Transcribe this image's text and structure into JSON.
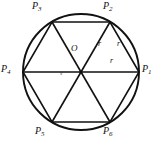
{
  "figure": {
    "stroke_color": "#111111",
    "background_color": "#ffffff",
    "circle": {
      "center_x": 81,
      "center_y": 72,
      "radius": 58,
      "stroke_width": 1.8
    },
    "hexagon": {
      "stroke_width": 1.6,
      "vertex_count": 6
    },
    "vertices": [
      {
        "id": "P1",
        "name": "P",
        "sub": "1",
        "x": 139,
        "y": 72,
        "label_x": 142,
        "label_y": 66
      },
      {
        "id": "P2",
        "name": "P",
        "sub": "2",
        "x": 110,
        "y": 22,
        "label_x": 104,
        "label_y": 3
      },
      {
        "id": "P3",
        "name": "P",
        "sub": "3",
        "x": 52,
        "y": 22,
        "label_x": 33,
        "label_y": 3
      },
      {
        "id": "P4",
        "name": "P",
        "sub": "4",
        "x": 23,
        "y": 72,
        "label_x": 2,
        "label_y": 66
      },
      {
        "id": "P5",
        "name": "P",
        "sub": "5",
        "x": 52,
        "y": 122,
        "label_x": 36,
        "label_y": 127
      },
      {
        "id": "P6",
        "name": "P",
        "sub": "6",
        "x": 110,
        "y": 122,
        "label_x": 104,
        "label_y": 127
      }
    ],
    "center_point": {
      "id": "O",
      "label": "O",
      "label_x": 71,
      "label_y": 45
    },
    "radius_labels": [
      {
        "text": "r",
        "x": 98,
        "y": 41
      },
      {
        "text": "r",
        "x": 117,
        "y": 41
      },
      {
        "text": "r",
        "x": 110,
        "y": 58
      }
    ],
    "side_labels": [
      {
        "text": "s",
        "x": 60,
        "y": 71
      }
    ]
  }
}
